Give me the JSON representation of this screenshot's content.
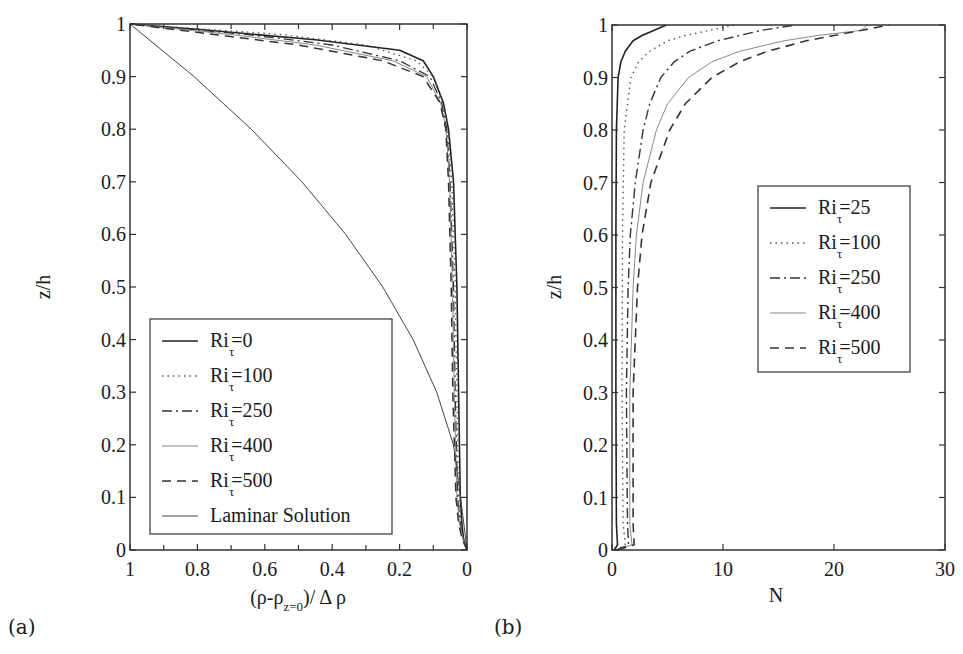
{
  "chart_data": [
    {
      "panel": "(a)",
      "type": "line",
      "title": "",
      "xlabel": "(ρ-ρ_{z=0})/ Δ ρ",
      "xlabel_parts": {
        "main": "(ρ-ρ",
        "sub": "z=0",
        "tail": ")/ Δ ρ"
      },
      "ylabel": "z/h",
      "xlim": [
        1,
        0
      ],
      "ylim": [
        0,
        1
      ],
      "x_reversed": true,
      "xticks": [
        "1",
        "0.8",
        "0.6",
        "0.4",
        "0.2",
        "0"
      ],
      "yticks": [
        "0",
        "0.1",
        "0.2",
        "0.3",
        "0.4",
        "0.5",
        "0.6",
        "0.7",
        "0.8",
        "0.9",
        "1"
      ],
      "grid": false,
      "legend_position": "lower left",
      "series": [
        {
          "name": "Ri_τ=0",
          "label_main": "Ri",
          "label_sub": "τ",
          "label_tail": "=0",
          "style": "solid",
          "color": "#222222",
          "width": 1.6,
          "z": [
            0,
            0.02,
            0.05,
            0.1,
            0.3,
            0.5,
            0.7,
            0.8,
            0.85,
            0.9,
            0.93,
            0.95,
            0.97,
            0.99,
            1.0
          ],
          "x": [
            0,
            0.01,
            0.015,
            0.02,
            0.025,
            0.03,
            0.04,
            0.055,
            0.07,
            0.1,
            0.13,
            0.2,
            0.45,
            0.8,
            1.0
          ]
        },
        {
          "name": "Ri_τ=100",
          "label_main": "Ri",
          "label_sub": "τ",
          "label_tail": "=100",
          "style": "dotted",
          "color": "#555555",
          "width": 1.3,
          "z": [
            0,
            0.02,
            0.05,
            0.1,
            0.3,
            0.5,
            0.7,
            0.8,
            0.85,
            0.9,
            0.93,
            0.96,
            0.98,
            1.0
          ],
          "x": [
            0,
            0.01,
            0.018,
            0.025,
            0.03,
            0.035,
            0.045,
            0.058,
            0.07,
            0.1,
            0.15,
            0.3,
            0.55,
            1.0
          ]
        },
        {
          "name": "Ri_τ=250",
          "label_main": "Ri",
          "label_sub": "τ",
          "label_tail": "=250",
          "style": "dashdot",
          "color": "#333333",
          "width": 1.3,
          "z": [
            0,
            0.02,
            0.05,
            0.1,
            0.3,
            0.5,
            0.7,
            0.8,
            0.85,
            0.9,
            0.93,
            0.96,
            0.98,
            1.0
          ],
          "x": [
            0,
            0.012,
            0.02,
            0.028,
            0.035,
            0.04,
            0.05,
            0.06,
            0.075,
            0.11,
            0.2,
            0.4,
            0.65,
            1.0
          ]
        },
        {
          "name": "Ri_τ=400",
          "label_main": "Ri",
          "label_sub": "τ",
          "label_tail": "=400",
          "style": "solid-thin",
          "color": "#888888",
          "width": 1.0,
          "z": [
            0,
            0.02,
            0.05,
            0.1,
            0.3,
            0.5,
            0.7,
            0.8,
            0.85,
            0.9,
            0.93,
            0.96,
            0.98,
            1.0
          ],
          "x": [
            0,
            0.012,
            0.022,
            0.03,
            0.038,
            0.043,
            0.052,
            0.062,
            0.078,
            0.12,
            0.22,
            0.45,
            0.7,
            1.0
          ]
        },
        {
          "name": "Ri_τ=500",
          "label_main": "Ri",
          "label_sub": "τ",
          "label_tail": "=500",
          "style": "dashed",
          "color": "#333333",
          "width": 1.5,
          "z": [
            0,
            0.02,
            0.05,
            0.1,
            0.3,
            0.5,
            0.7,
            0.8,
            0.85,
            0.9,
            0.93,
            0.96,
            0.98,
            1.0
          ],
          "x": [
            0,
            0.014,
            0.025,
            0.033,
            0.042,
            0.047,
            0.055,
            0.063,
            0.08,
            0.13,
            0.25,
            0.5,
            0.75,
            1.0
          ]
        },
        {
          "name": "Laminar Solution",
          "label_main": "Laminar Solution",
          "label_sub": "",
          "label_tail": "",
          "style": "solid-thin",
          "color": "#444444",
          "width": 1.0,
          "z": [
            0,
            0.1,
            0.2,
            0.3,
            0.4,
            0.5,
            0.6,
            0.7,
            0.8,
            0.9,
            1.0
          ],
          "x": [
            0,
            0.019,
            0.04,
            0.09,
            0.16,
            0.25,
            0.36,
            0.49,
            0.64,
            0.81,
            1.0
          ]
        }
      ]
    },
    {
      "panel": "(b)",
      "type": "line",
      "title": "",
      "xlabel": "N",
      "ylabel": "z/h",
      "xlim": [
        0,
        30
      ],
      "ylim": [
        0,
        1
      ],
      "xticks": [
        "0",
        "10",
        "20",
        "30"
      ],
      "yticks": [
        "0",
        "0.1",
        "0.2",
        "0.3",
        "0.4",
        "0.5",
        "0.6",
        "0.7",
        "0.8",
        "0.9",
        "1"
      ],
      "grid": false,
      "legend_position": "center right",
      "series": [
        {
          "name": "Ri_τ=25",
          "label_main": "Ri",
          "label_sub": "τ",
          "label_tail": "=25",
          "style": "solid",
          "color": "#222222",
          "width": 1.6,
          "z": [
            0,
            0.01,
            0.05,
            0.3,
            0.6,
            0.8,
            0.9,
            0.93,
            0.95,
            0.97,
            0.98,
            0.99,
            1.0
          ],
          "x": [
            0.2,
            0.5,
            0.4,
            0.35,
            0.35,
            0.4,
            0.55,
            0.8,
            1.2,
            1.9,
            2.7,
            3.8,
            4.9
          ]
        },
        {
          "name": "Ri_τ=100",
          "label_main": "Ri",
          "label_sub": "τ",
          "label_tail": "=100",
          "style": "dotted",
          "color": "#555555",
          "width": 1.4,
          "z": [
            0,
            0.01,
            0.05,
            0.3,
            0.6,
            0.8,
            0.9,
            0.93,
            0.95,
            0.97,
            0.98,
            0.99,
            1.0
          ],
          "x": [
            0.3,
            1.2,
            1.0,
            0.9,
            0.95,
            1.1,
            1.7,
            2.4,
            3.4,
            5.0,
            6.6,
            8.8,
            11.0
          ]
        },
        {
          "name": "Ri_τ=250",
          "label_main": "Ri",
          "label_sub": "τ",
          "label_tail": "=250",
          "style": "dashdot",
          "color": "#333333",
          "width": 1.4,
          "z": [
            0,
            0.01,
            0.05,
            0.3,
            0.5,
            0.6,
            0.7,
            0.8,
            0.85,
            0.9,
            0.93,
            0.95,
            0.97,
            0.98,
            0.99,
            1.0
          ],
          "x": [
            0.4,
            1.5,
            1.4,
            1.3,
            1.45,
            1.65,
            2.1,
            2.8,
            3.4,
            4.4,
            5.6,
            7.0,
            9.5,
            11.5,
            13.5,
            16.5
          ]
        },
        {
          "name": "Ri_τ=400",
          "label_main": "Ri",
          "label_sub": "τ",
          "label_tail": "=400",
          "style": "solid-thin",
          "color": "#888888",
          "width": 1.0,
          "z": [
            0,
            0.01,
            0.05,
            0.3,
            0.5,
            0.6,
            0.7,
            0.8,
            0.85,
            0.9,
            0.93,
            0.95,
            0.97,
            0.98,
            0.99,
            1.0
          ],
          "x": [
            0.4,
            1.8,
            1.6,
            1.6,
            1.9,
            2.2,
            2.8,
            4.0,
            5.0,
            6.9,
            9.0,
            11.5,
            15.5,
            18.5,
            22.5,
            23.0
          ]
        },
        {
          "name": "Ri_τ=500",
          "label_main": "Ri",
          "label_sub": "τ",
          "label_tail": "=500",
          "style": "dashed",
          "color": "#333333",
          "width": 1.6,
          "z": [
            0,
            0.01,
            0.05,
            0.3,
            0.5,
            0.6,
            0.7,
            0.8,
            0.85,
            0.9,
            0.93,
            0.95,
            0.97,
            0.98,
            0.99,
            1.0
          ],
          "x": [
            0.5,
            2.0,
            1.9,
            1.9,
            2.3,
            2.7,
            3.5,
            5.2,
            6.6,
            9.0,
            11.5,
            14.0,
            17.5,
            20.0,
            22.5,
            25.0
          ]
        }
      ]
    }
  ]
}
